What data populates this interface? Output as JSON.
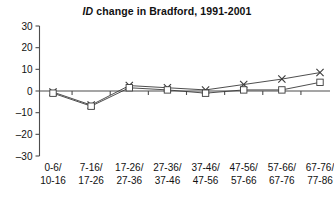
{
  "chart_data": {
    "type": "line",
    "title": "ID change in Bradford, 1991-2001",
    "title_italic_prefix": "ID",
    "title_rest": " change in Bradford, 1991-2001",
    "xlabel": "",
    "ylabel": "",
    "ylim": [
      -30,
      30
    ],
    "yticks": [
      30,
      20,
      10,
      0,
      -10,
      -20,
      -30
    ],
    "ytick_labels": [
      "30",
      "20",
      "10",
      "0",
      "–10",
      "–20",
      "–30"
    ],
    "grid": false,
    "legend": "none",
    "categories": [
      "0-6/\n10-16",
      "7-16/\n17-26",
      "17-26/\n27-36",
      "27-36/\n37-46",
      "37-46/\n47-56",
      "47-56/\n57-66",
      "57-66/\n67-76",
      "67-76/\n77-86"
    ],
    "category_lines": [
      {
        "top": "0-6/",
        "bottom": "10-16"
      },
      {
        "top": "7-16/",
        "bottom": "17-26"
      },
      {
        "top": "17-26/",
        "bottom": "27-36"
      },
      {
        "top": "27-36/",
        "bottom": "37-46"
      },
      {
        "top": "37-46/",
        "bottom": "47-56"
      },
      {
        "top": "47-56/",
        "bottom": "57-66"
      },
      {
        "top": "57-66/",
        "bottom": "67-76"
      },
      {
        "top": "67-76/",
        "bottom": "77-86"
      }
    ],
    "series": [
      {
        "name": "series-x",
        "marker": "x",
        "values": [
          -0.5,
          -6.5,
          2.5,
          1.5,
          0.5,
          3,
          5.5,
          8.5
        ]
      },
      {
        "name": "series-square",
        "marker": "square",
        "values": [
          -1,
          -7,
          1.5,
          0.5,
          -1,
          0.5,
          0.5,
          4
        ]
      }
    ],
    "colors": {
      "line": "#3a3a3a",
      "axis": "#4d4d4d",
      "marker_fill": "#ffffff",
      "text": "#111111",
      "background": "#ffffff"
    }
  }
}
